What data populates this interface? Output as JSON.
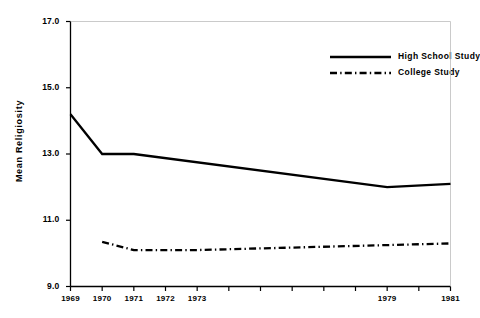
{
  "chart_data": {
    "type": "line",
    "title": "",
    "subtitle": "",
    "xlabel": "",
    "ylabel": "Mean Religiosity",
    "xlim": [
      1969,
      1981
    ],
    "ylim": [
      9.0,
      17.0
    ],
    "grid": false,
    "legend_position": "top-right",
    "y_ticks": [
      "17.0",
      "15.0",
      "13.0",
      "11.0",
      "9.0"
    ],
    "y_tick_values": [
      17.0,
      15.0,
      13.0,
      11.0,
      9.0
    ],
    "x_tick_values": [
      1969,
      1970,
      1971,
      1972,
      1973,
      1974,
      1975,
      1976,
      1977,
      1978,
      1979,
      1980,
      1981
    ],
    "x_tick_labels": [
      "1969",
      "1970",
      "1971",
      "1972",
      "1973",
      "",
      "",
      "",
      "",
      "",
      "1979",
      "",
      "1981"
    ],
    "series": [
      {
        "name": "High School Study",
        "style": "solid",
        "color": "#000000",
        "x": [
          1969,
          1970,
          1971,
          1979,
          1981
        ],
        "values": [
          14.2,
          13.0,
          13.0,
          12.0,
          12.1
        ]
      },
      {
        "name": "College Study",
        "style": "dash-dot",
        "color": "#000000",
        "x": [
          1970,
          1971,
          1973,
          1979,
          1981
        ],
        "values": [
          10.35,
          10.1,
          10.1,
          10.25,
          10.3
        ]
      }
    ]
  },
  "legend": {
    "items": [
      {
        "label": "High School Study",
        "style": "solid"
      },
      {
        "label": "College Study",
        "style": "dash-dot"
      }
    ]
  },
  "axes": {
    "y_title": "Mean Religiosity"
  }
}
